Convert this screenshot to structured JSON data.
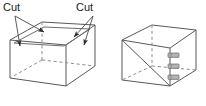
{
  "figure": {
    "title": "",
    "type": "technical-line-diagram",
    "colors": {
      "line": "#595959",
      "line_dark": "#3d3d3d",
      "hidden_line": "#8c8c8c",
      "text": "#1a1a1a",
      "hinge_fill": "#b3b3b3",
      "hinge_stroke": "#6b6b6b",
      "background": "#ffffff"
    },
    "labels": {
      "cut_left": "Cut",
      "cut_right": "Cut"
    },
    "left_box": {
      "name": "box-with-cut-marks",
      "arrow_count": 4,
      "arrow_targets": [
        "top-left-rear-edge",
        "top-left-front-edge",
        "top-right-rear-edge",
        "top-right-front-edge"
      ],
      "hidden_edges": 3
    },
    "right_box": {
      "name": "box-with-hinged-panel",
      "hinge_count": 3,
      "hinge_label": "hinge",
      "hidden_edges": 3
    }
  }
}
